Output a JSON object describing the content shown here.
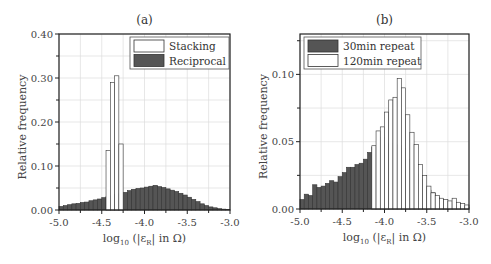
{
  "chart_data": [
    {
      "type": "bar",
      "panel": "(a)",
      "title": "(a)",
      "xlabel": "log10 (|εR| in Ω)",
      "ylabel": "Relative frequency",
      "xlim": [
        -5.0,
        -3.0
      ],
      "ylim": [
        0.0,
        0.4
      ],
      "xticks": [
        "-5.0",
        "-4.5",
        "-4.0",
        "-3.5",
        "-3.0"
      ],
      "yticks": [
        "0.00",
        "0.10",
        "0.20",
        "0.30",
        "0.40"
      ],
      "grid": true,
      "legend_position": "upper right",
      "bin_start": -5.0,
      "bin_width": 0.05,
      "series": [
        {
          "name": "Reciprocal",
          "fill": "#555555",
          "values": [
            0.008,
            0.01,
            0.012,
            0.014,
            0.015,
            0.017,
            0.018,
            0.021,
            0.023,
            0.025,
            0.028,
            0.031,
            0.032,
            0.035,
            0.038,
            0.04,
            0.044,
            0.047,
            0.049,
            0.05,
            0.052,
            0.054,
            0.056,
            0.053,
            0.051,
            0.048,
            0.045,
            0.042,
            0.038,
            0.034,
            0.029,
            0.024,
            0.019,
            0.014,
            0.01,
            0.007,
            0.005,
            0.003,
            0.002,
            0.001
          ]
        },
        {
          "name": "Stacking",
          "fill": "#ffffff",
          "values": [
            0,
            0,
            0,
            0,
            0,
            0,
            0,
            0,
            0,
            0,
            0,
            0.135,
            0.29,
            0.305,
            0.15,
            0,
            0,
            0,
            0,
            0,
            0,
            0,
            0,
            0,
            0,
            0,
            0,
            0,
            0,
            0,
            0,
            0,
            0,
            0,
            0,
            0,
            0,
            0,
            0,
            0
          ]
        }
      ],
      "legend": [
        "Stacking",
        "Reciprocal"
      ]
    },
    {
      "type": "bar",
      "panel": "(b)",
      "title": "(b)",
      "xlabel": "log10 (|εR| in Ω)",
      "ylabel": "Relative frequency",
      "xlim": [
        -5.0,
        -3.0
      ],
      "ylim": [
        0.0,
        0.13
      ],
      "xticks": [
        "-5.0",
        "-4.5",
        "-4.0",
        "-3.5",
        "-3.0"
      ],
      "yticks": [
        "0.00",
        "0.05",
        "0.10"
      ],
      "grid": true,
      "legend_position": "upper left",
      "bin_start": -5.0,
      "bin_width": 0.05,
      "series": [
        {
          "name": "30min repeat",
          "fill": "#555555",
          "values": [
            0.007,
            0.011,
            0.01,
            0.018,
            0.016,
            0.017,
            0.019,
            0.021,
            0.02,
            0.024,
            0.027,
            0.031,
            0.031,
            0.033,
            0.034,
            0.037,
            0.042,
            0.046,
            0.046,
            0.053,
            0.048,
            0.049,
            0.048,
            0.047,
            0.045,
            0.037,
            0.033,
            0.026,
            0.022,
            0.017,
            0.014,
            0.012,
            0.009,
            0.007,
            0.006,
            0.004,
            0.003,
            0.002,
            0.002,
            0.001
          ]
        },
        {
          "name": "120min repeat",
          "fill": "#ffffff",
          "values": [
            0,
            0,
            0,
            0,
            0,
            0,
            0,
            0,
            0,
            0,
            0,
            0,
            0,
            0,
            0,
            0,
            0,
            0.047,
            0.058,
            0.061,
            0.072,
            0.081,
            0.083,
            0.097,
            0.09,
            0.07,
            0.057,
            0.048,
            0.033,
            0.025,
            0.017,
            0.012,
            0.01,
            0.008,
            0.007,
            0.006,
            0.008,
            0.005,
            0.004,
            0.003
          ]
        }
      ],
      "legend": [
        "30min repeat",
        "120min repeat"
      ]
    }
  ],
  "panels": {
    "a": {
      "title": "(a)",
      "ylabel": "Relative frequency",
      "legend": [
        "Stacking",
        "Reciprocal"
      ]
    },
    "b": {
      "title": "(b)",
      "ylabel": "Relative frequency",
      "legend": [
        "30min repeat",
        "120min repeat"
      ]
    }
  },
  "colors": {
    "dark_bar": "#555555",
    "light_bar": "#ffffff",
    "edge": "#333333",
    "grid": "#dddddd"
  }
}
